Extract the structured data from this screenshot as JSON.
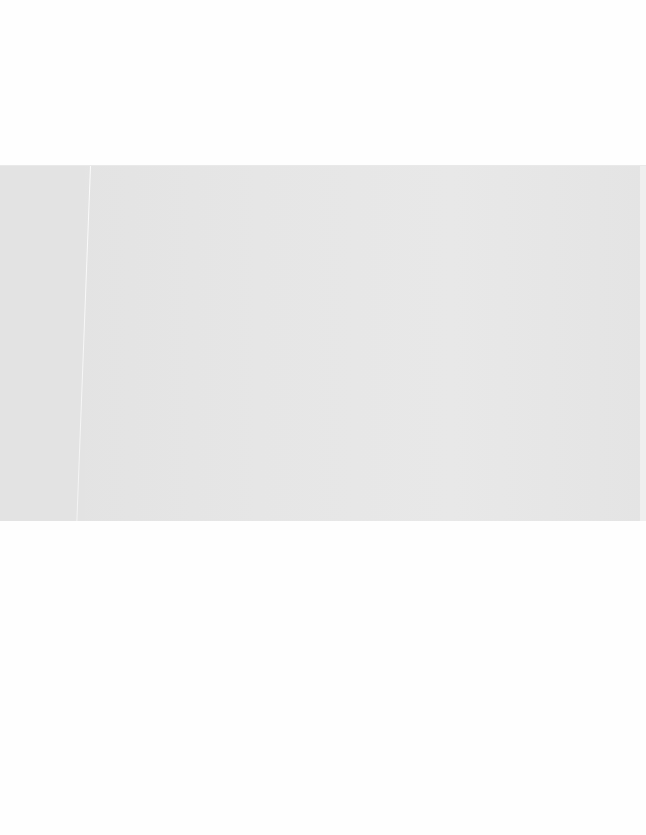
{
  "page": {
    "background": "#fefefe"
  },
  "image_area": {
    "color": "#e5e5e5",
    "content": ""
  }
}
